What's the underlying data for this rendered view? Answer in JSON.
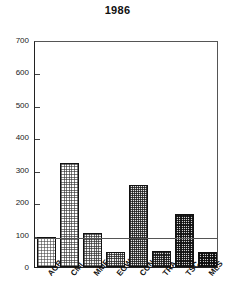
{
  "chart_data": {
    "type": "bar",
    "title": "1986",
    "xlabel": "",
    "ylabel": "",
    "categories": [
      "AGR",
      "CMI",
      "MMF",
      "EGW",
      "CON",
      "TRA",
      "TSC",
      "MLS"
    ],
    "values": [
      93,
      320,
      105,
      47,
      253,
      48,
      163,
      47
    ],
    "ylim": [
      0,
      700
    ],
    "yticks": [
      0,
      100,
      200,
      300,
      400,
      500,
      600,
      700
    ],
    "ytick_labels": [
      "0",
      "100",
      "200",
      "300",
      "400",
      "500",
      "600",
      "700"
    ],
    "grid": false,
    "legend": "none",
    "annotations": [
      {
        "type": "reference-line",
        "orientation": "horizontal",
        "value": 95
      }
    ],
    "bar_fills": [
      "d1",
      "d2",
      "d3",
      "d4",
      "d5",
      "d6",
      "d7",
      "d8"
    ],
    "colors": {
      "axis": "#222222",
      "frame": "#555555",
      "bar_outline": "#111111",
      "reference_line": "#555555",
      "background": "#ffffff",
      "text": "#111111"
    }
  }
}
